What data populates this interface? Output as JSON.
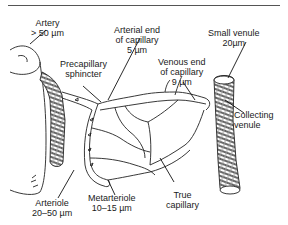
{
  "diagram": {
    "labels": {
      "artery": {
        "name": "Artery",
        "size": "> 50 µm"
      },
      "precapillary_sphincter": {
        "line1": "Precapillary",
        "line2": "sphincter"
      },
      "arterial_end": {
        "line1": "Arterial end",
        "line2": "of capillary",
        "size": "5 µm"
      },
      "small_venule": {
        "name": "Small venule",
        "size": "20µm"
      },
      "venous_end": {
        "line1": "Venous end",
        "line2": "of capillary",
        "size": "9 µm"
      },
      "collecting_venule": {
        "line1": "Collecting",
        "line2": "venule"
      },
      "arteriole": {
        "name": "Arteriole",
        "size": "20–50 µm"
      },
      "metarteriole": {
        "name": "Metarteriole",
        "size": "10–15 µm"
      },
      "true_capillary": {
        "line1": "True",
        "line2": "capillary"
      }
    },
    "colors": {
      "line": "#1a1a1a",
      "background": "#ffffff",
      "rule": "#555555"
    }
  }
}
